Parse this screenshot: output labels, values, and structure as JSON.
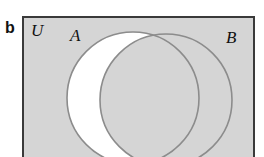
{
  "figure": {
    "panel_label": "b",
    "type": "venn-diagram",
    "canvas": {
      "width": 264,
      "height": 157,
      "background": "#ffffff"
    }
  },
  "universal_set": {
    "label": "U",
    "fill_color": "#d5d5d5",
    "border_color": "#3a3a3a",
    "border_width": 2,
    "x": 23,
    "y": 17,
    "width": 231,
    "height": 148,
    "note_cropped_bottom": true,
    "label_x": 31,
    "label_y": 36
  },
  "sets": [
    {
      "name": "A",
      "label": "A",
      "position": "left",
      "cx": 133,
      "cy": 98,
      "r": 66,
      "fill_color": "#ffffff",
      "stroke_color": "#8c8c8c",
      "stroke_width": 1.6,
      "label_x": 70,
      "label_y": 41
    },
    {
      "name": "B",
      "label": "B",
      "position": "right",
      "cx": 166,
      "cy": 100,
      "r": 66,
      "fill_color": "none",
      "stroke_color": "#8c8c8c",
      "stroke_width": 1.6,
      "label_x": 226,
      "label_y": 43
    }
  ],
  "shading": {
    "description": "A minus B",
    "shaded_region": "A \\ B",
    "shaded_color": "#ffffff",
    "unshaded_color": "#d5d5d5",
    "intersection_shaded": false
  }
}
